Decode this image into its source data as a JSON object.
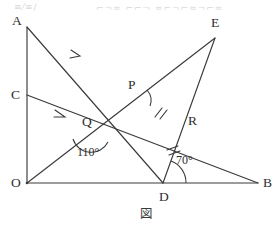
{
  "figure": {
    "caption": "図",
    "vertex_labels": {
      "A": "A",
      "B": "B",
      "C": "C",
      "D": "D",
      "E": "E",
      "O": "O",
      "P": "P",
      "Q": "Q",
      "R": "R"
    },
    "angle_labels": {
      "at_Q": "110°",
      "at_D": "70°"
    },
    "points": {
      "O": {
        "x": 27,
        "y": 183
      },
      "A": {
        "x": 27,
        "y": 27
      },
      "C": {
        "x": 27,
        "y": 95
      },
      "B": {
        "x": 258,
        "y": 183
      },
      "D": {
        "x": 163,
        "y": 183
      },
      "E": {
        "x": 215,
        "y": 38
      },
      "P": {
        "x": 137,
        "y": 95
      },
      "Q": {
        "x": 91,
        "y": 132
      },
      "R": {
        "x": 184,
        "y": 128
      }
    },
    "segments": [
      {
        "name": "OA",
        "from": "O",
        "to": "A"
      },
      {
        "name": "OB",
        "from": "O",
        "to": "B"
      },
      {
        "name": "AD",
        "from": "A",
        "to": "D"
      },
      {
        "name": "CB",
        "from": "C",
        "to": "B"
      },
      {
        "name": "OE",
        "from": "O",
        "to": "E"
      },
      {
        "name": "DE",
        "from": "D",
        "to": "E"
      }
    ],
    "parallel_arrows": [
      {
        "on": "AD",
        "x": 78,
        "y": 53
      },
      {
        "on": "CB",
        "x": 62,
        "y": 115
      }
    ],
    "equal_marks": [
      {
        "on": "PR",
        "count": 2
      },
      {
        "on": "DR",
        "count": 2
      }
    ],
    "colors": {
      "ink": "#3a3a3a",
      "text": "#2e2e2e",
      "background": "#ffffff"
    }
  },
  "artifacts": {
    "top_bleed_left": "≡⁄≡∕",
    "top_bleed_right": "⌐¬≈ ⌐⌐¬ ≈⌐¬⌐≈¬⌐≈"
  }
}
